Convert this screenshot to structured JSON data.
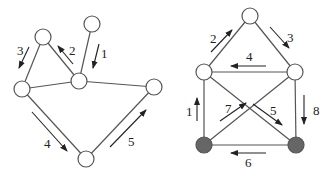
{
  "colors": {
    "edge": "#555555",
    "arrow": "#222222",
    "node_fill": "#ffffff",
    "node_stroke": "#555555",
    "filled_node": "#666666"
  },
  "graphs": [
    {
      "name": "left-graph",
      "nodes": [
        {
          "id": "a",
          "x": 92,
          "y": 24,
          "filled": false
        },
        {
          "id": "b",
          "x": 43,
          "y": 37,
          "filled": false
        },
        {
          "id": "c",
          "x": 79,
          "y": 81,
          "filled": false
        },
        {
          "id": "d",
          "x": 22,
          "y": 89,
          "filled": false
        },
        {
          "id": "e",
          "x": 154,
          "y": 87,
          "filled": false
        },
        {
          "id": "f",
          "x": 86,
          "y": 159,
          "filled": false
        }
      ],
      "edges": [
        [
          "a",
          "c"
        ],
        [
          "b",
          "c"
        ],
        [
          "b",
          "d"
        ],
        [
          "d",
          "c"
        ],
        [
          "c",
          "e"
        ],
        [
          "d",
          "f"
        ],
        [
          "f",
          "e"
        ]
      ],
      "arrows": [
        {
          "label": "1",
          "x1": 99,
          "y1": 44,
          "x2": 93,
          "y2": 68,
          "lx": 101,
          "ly": 58
        },
        {
          "label": "2",
          "x1": 73,
          "y1": 64,
          "x2": 58,
          "y2": 46,
          "lx": 69,
          "ly": 55
        },
        {
          "label": "3",
          "x1": 29,
          "y1": 47,
          "x2": 19,
          "y2": 68,
          "lx": 17,
          "ly": 55
        },
        {
          "label": "4",
          "x1": 32,
          "y1": 112,
          "x2": 67,
          "y2": 151,
          "lx": 44,
          "ly": 148
        },
        {
          "label": "5",
          "x1": 110,
          "y1": 147,
          "x2": 146,
          "y2": 110,
          "lx": 128,
          "ly": 146
        }
      ]
    },
    {
      "name": "right-graph",
      "nodes": [
        {
          "id": "t",
          "x": 250,
          "y": 16,
          "filled": false
        },
        {
          "id": "ml",
          "x": 204,
          "y": 72,
          "filled": false
        },
        {
          "id": "mr",
          "x": 295,
          "y": 72,
          "filled": false
        },
        {
          "id": "bl",
          "x": 204,
          "y": 145,
          "filled": true
        },
        {
          "id": "br",
          "x": 296,
          "y": 145,
          "filled": true
        }
      ],
      "edges": [
        [
          "t",
          "ml"
        ],
        [
          "t",
          "mr"
        ],
        [
          "ml",
          "mr"
        ],
        [
          "ml",
          "bl"
        ],
        [
          "mr",
          "br"
        ],
        [
          "bl",
          "br"
        ],
        [
          "ml",
          "br"
        ],
        [
          "mr",
          "bl"
        ]
      ],
      "arrows": [
        {
          "label": "1",
          "x1": 197,
          "y1": 121,
          "x2": 197,
          "y2": 98,
          "lx": 186,
          "ly": 116
        },
        {
          "label": "2",
          "x1": 211,
          "y1": 52,
          "x2": 232,
          "y2": 30,
          "lx": 210,
          "ly": 43
        },
        {
          "label": "3",
          "x1": 270,
          "y1": 27,
          "x2": 289,
          "y2": 48,
          "lx": 287,
          "ly": 42
        },
        {
          "label": "4",
          "x1": 266,
          "y1": 66,
          "x2": 231,
          "y2": 66,
          "lx": 246,
          "ly": 61
        },
        {
          "label": "5",
          "x1": 253,
          "y1": 104,
          "x2": 282,
          "y2": 125,
          "lx": 270,
          "ly": 115
        },
        {
          "label": "6",
          "x1": 266,
          "y1": 153,
          "x2": 231,
          "y2": 153,
          "lx": 245,
          "ly": 167
        },
        {
          "label": "7",
          "x1": 220,
          "y1": 121,
          "x2": 246,
          "y2": 103,
          "lx": 225,
          "ly": 113
        },
        {
          "label": "8",
          "x1": 304,
          "y1": 95,
          "x2": 304,
          "y2": 124,
          "lx": 313,
          "ly": 115
        }
      ]
    }
  ]
}
